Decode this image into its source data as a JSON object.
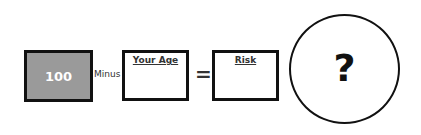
{
  "equation": {
    "operand_1": {
      "value": "100",
      "fill_color": "#9a9a9a"
    },
    "operator_1": "Minus",
    "operand_2": {
      "label": "Your Age",
      "value": ""
    },
    "operator_2": "=",
    "result": {
      "label": "Risk",
      "value": ""
    },
    "answer": {
      "symbol": "?"
    }
  }
}
